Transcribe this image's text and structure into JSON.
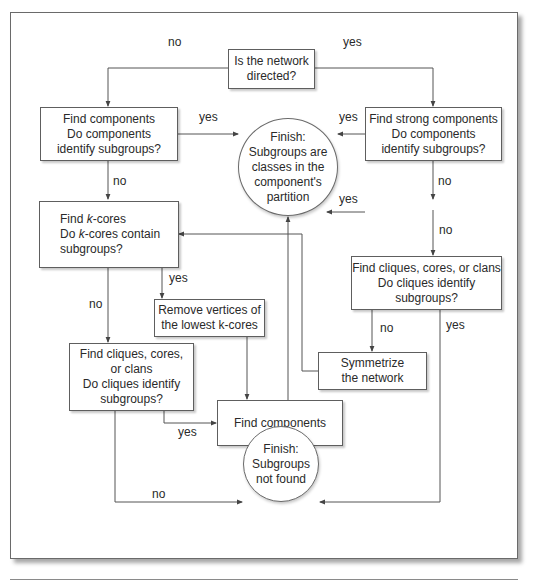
{
  "nodes": {
    "start": {
      "lines": [
        "Is the network",
        "directed?"
      ]
    },
    "find_components": {
      "lines": [
        "Find components",
        "Do components",
        "identify subgroups?"
      ]
    },
    "find_strong_components": {
      "lines": [
        "Find strong components",
        "Do components",
        "identify subgroups?"
      ]
    },
    "finish_found": {
      "lines": [
        "Finish:",
        "Subgroups are",
        "classes in the",
        "component's",
        "partition"
      ]
    },
    "find_kcores": {
      "line1_pre": "Find ",
      "line1_k": "k",
      "line1_post": "-cores",
      "line2_pre": "Do ",
      "line2_k": "k",
      "line2_post": "-cores contain",
      "line3": "subgroups?"
    },
    "remove_vertices": {
      "lines": [
        "Remove vertices of",
        "the lowest k-cores"
      ]
    },
    "find_cliques_left": {
      "lines": [
        "Find cliques, cores,",
        "or clans",
        "Do cliques identify",
        "subgroups?"
      ]
    },
    "find_cliques_right": {
      "lines": [
        "Find cliques, cores, or clans",
        "Do cliques identify",
        "subgroups?"
      ]
    },
    "symmetrize": {
      "lines": [
        "Symmetrize",
        "the network"
      ]
    },
    "find_components_bottom": {
      "lines": [
        "Find components"
      ]
    },
    "finish_not_found": {
      "lines": [
        "Finish:",
        "Subgroups",
        "not found"
      ]
    }
  },
  "edge_labels": {
    "start_no": "no",
    "start_yes": "yes",
    "components_yes": "yes",
    "strong_yes": "yes",
    "components_no": "no",
    "strong_no": "no",
    "floating_yes": "yes",
    "strong_no_2": "no",
    "kcores_yes": "yes",
    "kcores_no": "no",
    "cliques_right_no": "no",
    "cliques_right_yes": "yes",
    "cliques_left_yes": "yes",
    "cliques_left_no": "no"
  },
  "colors": {
    "line": "#555555",
    "border": "#5e5e5e",
    "text": "#2a2a2a"
  }
}
